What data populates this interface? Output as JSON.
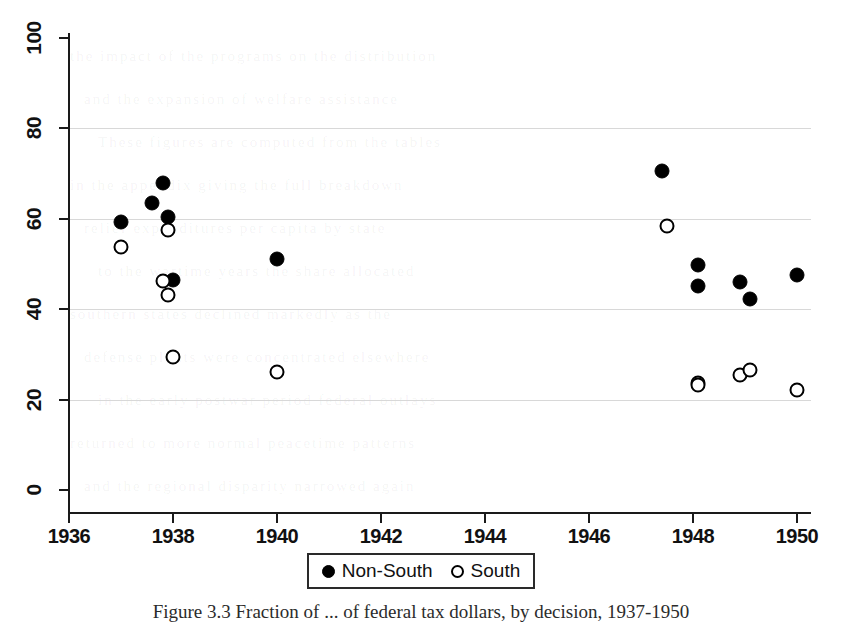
{
  "figure": {
    "caption": "Figure 3.3  Fraction of ... of federal tax dollars, by decision, 1937-1950",
    "background_color": "#ffffff",
    "ink_color": "#000000",
    "gridline_color": "#d8d8d8"
  },
  "legend": {
    "position": "bottom-center",
    "entries": [
      {
        "label": "Non-South",
        "marker": "filled-circle",
        "color": "#000000"
      },
      {
        "label": "South",
        "marker": "open-circle",
        "color": "#000000"
      }
    ]
  },
  "axes": {
    "x": {
      "label": "",
      "ticks": [
        1936,
        1938,
        1940,
        1942,
        1944,
        1946,
        1948,
        1950
      ],
      "tick_labels": [
        "1936",
        "1938",
        "1940",
        "1942",
        "1944",
        "1946",
        "1948",
        "1950"
      ],
      "min": 1935.6,
      "max": 1950.6
    },
    "y": {
      "label": "",
      "ticks": [
        0,
        20,
        40,
        60,
        80,
        100
      ],
      "tick_labels": [
        "0",
        "20",
        "40",
        "60",
        "80",
        "100"
      ],
      "min": 0,
      "max": 106
    }
  },
  "chart_data": {
    "type": "scatter",
    "title": "",
    "xlabel": "",
    "ylabel": "",
    "xlim": [
      1935.6,
      1950.6
    ],
    "ylim": [
      0,
      106
    ],
    "grid": "horizontal",
    "gridlines_y": [
      20,
      40,
      60,
      80
    ],
    "series": [
      {
        "name": "Non-South",
        "marker": "filled-circle",
        "color": "#000000",
        "points": [
          {
            "x": 1937.0,
            "y": 59.2
          },
          {
            "x": 1937.6,
            "y": 63.4
          },
          {
            "x": 1937.8,
            "y": 68.0
          },
          {
            "x": 1937.9,
            "y": 60.4
          },
          {
            "x": 1938.0,
            "y": 46.4
          },
          {
            "x": 1940.0,
            "y": 51.1
          },
          {
            "x": 1947.4,
            "y": 70.6
          },
          {
            "x": 1948.1,
            "y": 49.8
          },
          {
            "x": 1948.1,
            "y": 45.1
          },
          {
            "x": 1948.9,
            "y": 46.1
          },
          {
            "x": 1949.1,
            "y": 42.3
          },
          {
            "x": 1950.0,
            "y": 47.6
          }
        ]
      },
      {
        "name": "South",
        "marker": "open-circle",
        "color": "#000000",
        "points": [
          {
            "x": 1937.0,
            "y": 53.8
          },
          {
            "x": 1937.8,
            "y": 46.3
          },
          {
            "x": 1937.9,
            "y": 57.6
          },
          {
            "x": 1937.9,
            "y": 43.2
          },
          {
            "x": 1938.0,
            "y": 29.4
          },
          {
            "x": 1940.0,
            "y": 26.1
          },
          {
            "x": 1947.5,
            "y": 58.3
          },
          {
            "x": 1948.1,
            "y": 23.6
          },
          {
            "x": 1948.1,
            "y": 23.2
          },
          {
            "x": 1948.9,
            "y": 25.5
          },
          {
            "x": 1949.1,
            "y": 26.5
          },
          {
            "x": 1950.0,
            "y": 22.2
          }
        ]
      }
    ]
  },
  "bleed_text": {
    "lines": [
      "the impact of the programs on the distribution",
      "and the expansion of welfare assistance",
      "These figures are computed from the tables",
      "in the appendix giving the full breakdown",
      "relief expenditures per capita by state",
      "to the wartime years the share allocated",
      "southern states declined markedly as the",
      "defense plants were concentrated elsewhere",
      "in the early postwar period federal outlays",
      "returned to more normal peacetime patterns",
      "and the regional disparity narrowed again"
    ]
  }
}
